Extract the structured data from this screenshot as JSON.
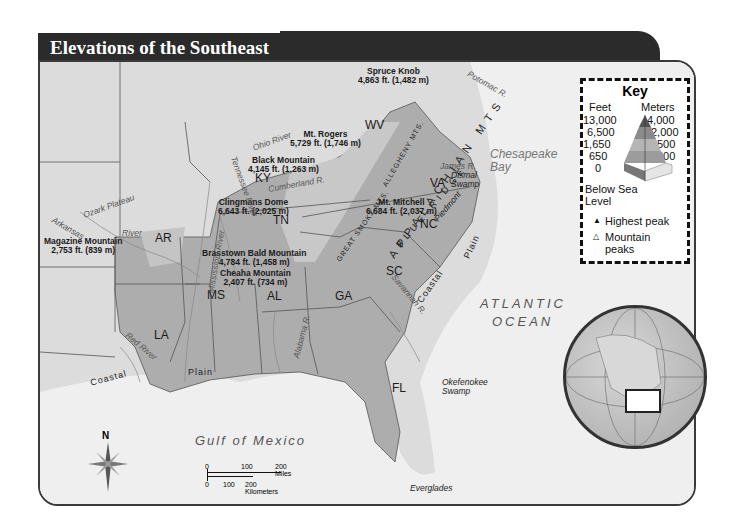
{
  "title": "Elevations of the Southeast",
  "key": {
    "title": "Key",
    "feet_header": "Feet",
    "meters_header": "Meters",
    "feet_values": [
      "13,000",
      "6,500",
      "1,650",
      "650",
      "0"
    ],
    "meters_values": [
      "4,000",
      "2,000",
      "500",
      "200",
      "0"
    ],
    "below_sea_level": "Below Sea Level",
    "highest_peak_symbol": "▲",
    "highest_peak_label": "Highest peak",
    "mountain_peak_symbol": "△",
    "mountain_peak_label": "Mountain peaks"
  },
  "states": [
    "AR",
    "LA",
    "MS",
    "AL",
    "GA",
    "FL",
    "SC",
    "NC",
    "TN",
    "KY",
    "VA",
    "WV"
  ],
  "peaks": [
    {
      "name": "Spruce Knob",
      "elev": "4,863 ft. (1,482 m)"
    },
    {
      "name": "Mt. Rogers",
      "elev": "5,729 ft. (1,746 m)"
    },
    {
      "name": "Black Mountain",
      "elev": "4,145 ft. (1,263 m)"
    },
    {
      "name": "Clingmans Dome",
      "elev": "6,643 ft. (2,025 m)"
    },
    {
      "name": "Mt. Mitchell",
      "elev": "6,684 ft. (2,037 m)"
    },
    {
      "name": "Brasstown Bald Mountain",
      "elev": "4,784 ft. (1,458 m)"
    },
    {
      "name": "Cheaha Mountain",
      "elev": "2,407 ft. (734 m)"
    },
    {
      "name": "Magazine Mountain",
      "elev": "2,753 ft. (839 m)"
    }
  ],
  "features": {
    "ozark": "Ozark Plateau",
    "arkansas_river": "Arkansas",
    "river": "River",
    "mississippi": "Mississippi River",
    "tennessee": "Tennessee River",
    "ohio": "Ohio River",
    "cumberland": "Cumberland R.",
    "red_river": "Red River",
    "alabama": "Alabama R.",
    "savannah": "Savannah R.",
    "james": "James R.",
    "potomac": "Potomac R.",
    "allegheny": "ALLEGHENY MTS.",
    "smoky": "GREAT SMOKY MTS.",
    "appalachian": "APPALACHIAN MTS",
    "blue_ridge": "BLUE RIDGE",
    "piedmont": "Piedmont",
    "coastal": "Coastal",
    "plain": "Plain",
    "dismal": "Dismal Swamp",
    "chesapeake": "Chesapeake Bay",
    "okefenokee": "Okefenokee Swamp",
    "everglades": "Everglades",
    "atlantic1": "ATLANTIC",
    "atlantic2": "OCEAN",
    "gulf": "Gulf of Mexico"
  },
  "compass": {
    "north": "N"
  },
  "scale": {
    "miles": [
      "0",
      "100",
      "200 Miles"
    ],
    "km": [
      "0",
      "100",
      "200 Kilometers"
    ]
  },
  "colors": {
    "land_low": "#a9a9a9",
    "land_mid": "#c6c6c6",
    "outside": "#dcdcdc",
    "water": "#eeeeee",
    "title_bg": "#2b2b2b"
  }
}
